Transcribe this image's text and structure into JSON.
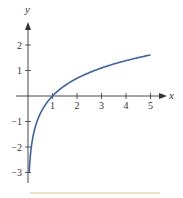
{
  "chart_data": {
    "type": "line",
    "title": "",
    "function": "y = ln(x)",
    "xlabel": "x",
    "ylabel": "y",
    "xlim": [
      0,
      5.6
    ],
    "ylim": [
      -3.4,
      2.6
    ],
    "grid": false,
    "legend": null,
    "x_ticks": [
      "1",
      "2",
      "3",
      "4",
      "5"
    ],
    "y_ticks": [
      "-3",
      "-2",
      "-1",
      "1",
      "2"
    ],
    "series": [
      {
        "name": "ln(x)",
        "color": "#3a62a8",
        "x": [
          0.05,
          0.1,
          0.2,
          0.3,
          0.5,
          0.75,
          1,
          1.5,
          2,
          2.5,
          3,
          3.5,
          4,
          4.5,
          5
        ],
        "y": [
          -3.0,
          -2.3,
          -1.61,
          -1.2,
          -0.69,
          -0.29,
          0,
          0.41,
          0.69,
          0.92,
          1.1,
          1.25,
          1.39,
          1.5,
          1.61
        ]
      }
    ]
  },
  "colors": {
    "axis": "#333333",
    "curve": "#3a62a8",
    "footer_rule": "#efe3c4"
  }
}
